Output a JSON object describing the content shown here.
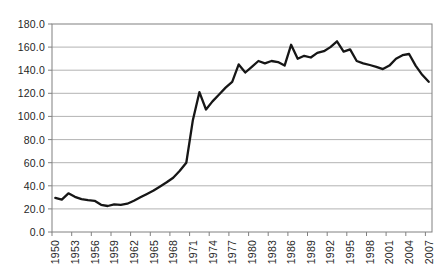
{
  "chart_data": {
    "type": "line",
    "title": "",
    "xlabel": "",
    "ylabel": "",
    "legend": "none",
    "grid": "horizontal-only",
    "ylim": [
      0,
      180
    ],
    "ytick_step": 20,
    "ytick_labels": [
      "0.0",
      "20.0",
      "40.0",
      "60.0",
      "80.0",
      "100.0",
      "120.0",
      "140.0",
      "160.0",
      "180.0"
    ],
    "xtick_interval": 3,
    "xtick_labels": [
      "1950",
      "1953",
      "1956",
      "1959",
      "1962",
      "1965",
      "1968",
      "1971",
      "1974",
      "1977",
      "1980",
      "1983",
      "1986",
      "1989",
      "1992",
      "1995",
      "1998",
      "2001",
      "2004",
      "2007"
    ],
    "x_years": [
      1950,
      1951,
      1952,
      1953,
      1954,
      1955,
      1956,
      1957,
      1958,
      1959,
      1960,
      1961,
      1962,
      1963,
      1964,
      1965,
      1966,
      1967,
      1968,
      1969,
      1970,
      1971,
      1972,
      1973,
      1974,
      1975,
      1976,
      1977,
      1978,
      1979,
      1980,
      1981,
      1982,
      1983,
      1984,
      1985,
      1986,
      1987,
      1988,
      1989,
      1990,
      1991,
      1992,
      1993,
      1994,
      1995,
      1996,
      1997,
      1998,
      1999,
      2000,
      2001,
      2002,
      2003,
      2004,
      2005,
      2006,
      2007
    ],
    "values": [
      29.5,
      28,
      33.5,
      30.5,
      28.5,
      27.5,
      27,
      23.5,
      22.5,
      24,
      23.5,
      24.5,
      27,
      30,
      33,
      36,
      39.5,
      43,
      47,
      53,
      60,
      97,
      121,
      106,
      113,
      119,
      125,
      130,
      145,
      138,
      143,
      148,
      146,
      148,
      147,
      144,
      162,
      150,
      152.5,
      151,
      155,
      156.5,
      160,
      165,
      156,
      158,
      148,
      146,
      144.5,
      143,
      141,
      144,
      150,
      153,
      154,
      144,
      136,
      130
    ],
    "colors": {
      "line": "#161616",
      "grid": "#b3b3b3",
      "border": "#808080",
      "tick": "#808080",
      "label": "#1f1f1f",
      "background": "#ffffff"
    }
  }
}
